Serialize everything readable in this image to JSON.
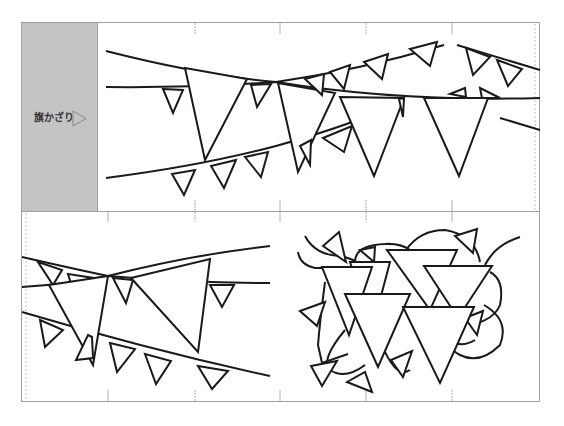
{
  "template": {
    "label": "旗かざり",
    "label_arrow_icon": "outline-triangle-right",
    "colors": {
      "label_panel_bg": "#c4c4c4",
      "frame": "#a0a0a0",
      "stroke": "#1a1a1a",
      "background": "#ffffff"
    },
    "panels": [
      {
        "id": "top-banner",
        "title": "",
        "description": "Three strings of pennant bunting with large and small triangular flags"
      },
      {
        "id": "bottom-left",
        "title": "",
        "description": "Three crossing bunting strings with triangular flags"
      },
      {
        "id": "bottom-right",
        "title": "",
        "description": "Tangled string of overlapping triangular flags"
      }
    ]
  }
}
